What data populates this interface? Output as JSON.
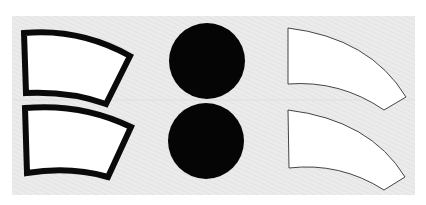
{
  "scene": {
    "background": "#ffffff",
    "panel": {
      "x": 12,
      "y": 16,
      "width": 403,
      "height": 179,
      "fill": "#e9e9e9",
      "stripe": "#dcdcdc"
    },
    "shapes": {
      "thick_outline": {
        "stroke": "#0a0a0a",
        "fill": "#ffffff",
        "stroke_width": 6
      },
      "solid_circle": {
        "fill": "#050505"
      },
      "thin_outline": {
        "stroke": "#444444",
        "fill": "#ffffff",
        "stroke_width": 1
      }
    },
    "items": [
      {
        "name": "thick-outlined-sleeve-top",
        "type": "arc-panel",
        "style": "thick_outline"
      },
      {
        "name": "thick-outlined-sleeve-bottom",
        "type": "arc-panel",
        "style": "thick_outline"
      },
      {
        "name": "solid-circle-top",
        "type": "circle",
        "cx": 207,
        "cy": 61,
        "r": 38
      },
      {
        "name": "solid-circle-bottom",
        "type": "circle",
        "cx": 206,
        "cy": 141,
        "r": 38
      },
      {
        "name": "thin-outlined-sleeve-top",
        "type": "arc-panel",
        "style": "thin_outline"
      },
      {
        "name": "thin-outlined-sleeve-bottom",
        "type": "arc-panel",
        "style": "thin_outline"
      }
    ]
  }
}
